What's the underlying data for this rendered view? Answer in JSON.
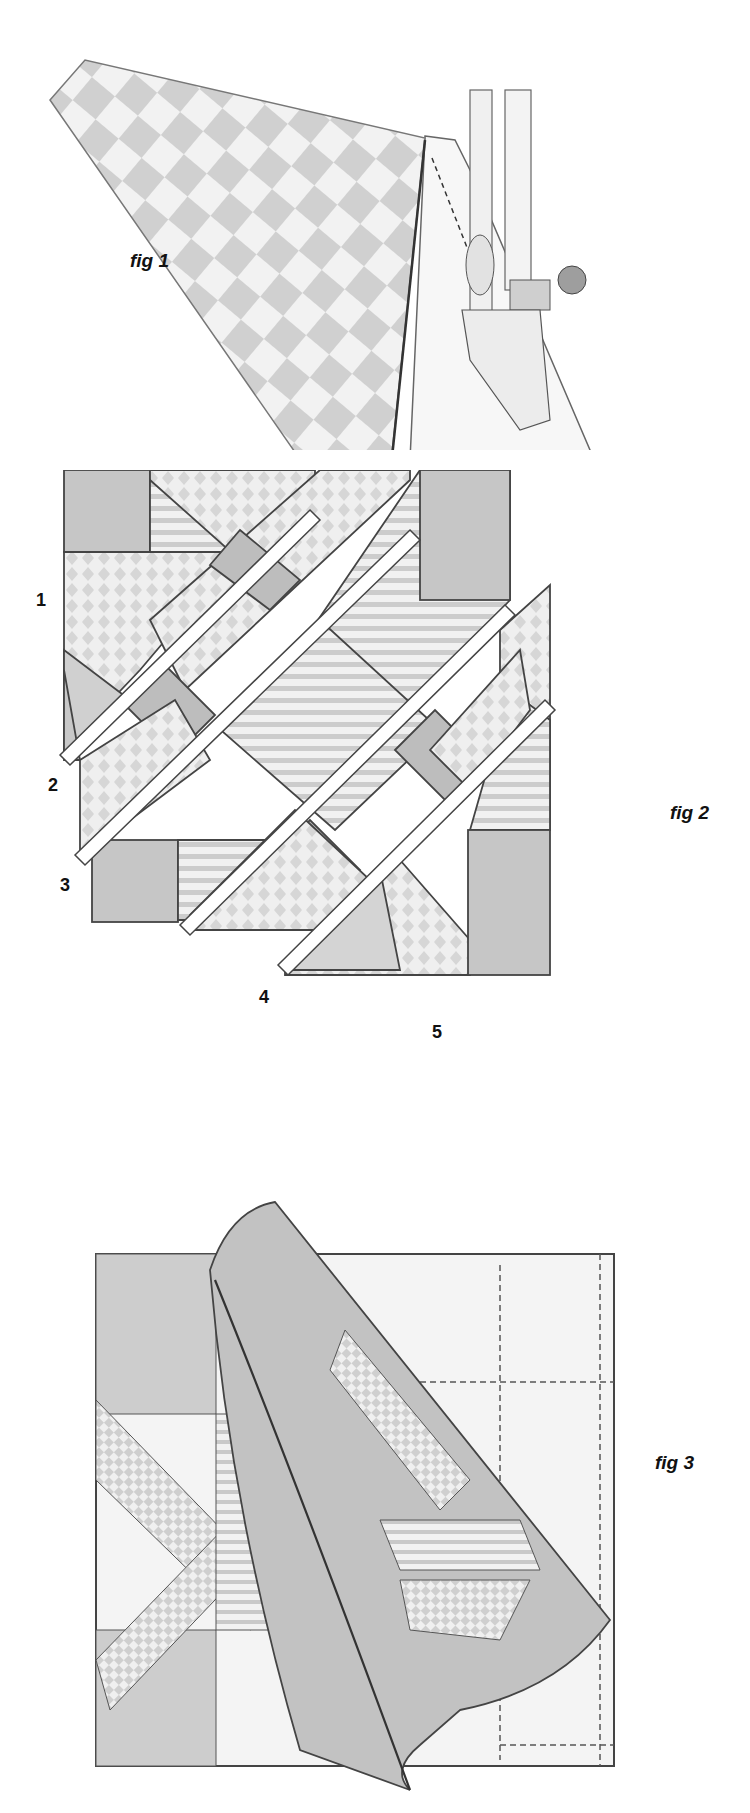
{
  "figures": [
    {
      "id": "fig1",
      "caption": "fig 1",
      "description": "Checkerboard fabric folded over plain fabric, being sewn under a sewing machine presser foot with dashed stitch line"
    },
    {
      "id": "fig2",
      "caption": "fig 2",
      "description": "Quilt block pieces laid out in diagonal rows separated by gaps",
      "row_labels": [
        "1",
        "2",
        "3",
        "4",
        "5"
      ]
    },
    {
      "id": "fig3",
      "caption": "fig 3",
      "description": "Assembled quilt block with backing corner peeled back showing seam stitching"
    }
  ],
  "colors": {
    "fabric_dark": "#bdbdbd",
    "fabric_mid": "#d2d2d2",
    "fabric_light": "#e9e9e9",
    "outline": "#444444",
    "background": "#ffffff"
  }
}
